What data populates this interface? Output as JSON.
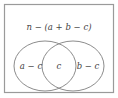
{
  "diagram": {
    "type": "venn",
    "outside_label": "n − (a + b − c)",
    "regions": {
      "left_only": "a − c",
      "intersection": "c",
      "right_only": "b − c"
    },
    "sets": [
      "a",
      "b"
    ]
  }
}
